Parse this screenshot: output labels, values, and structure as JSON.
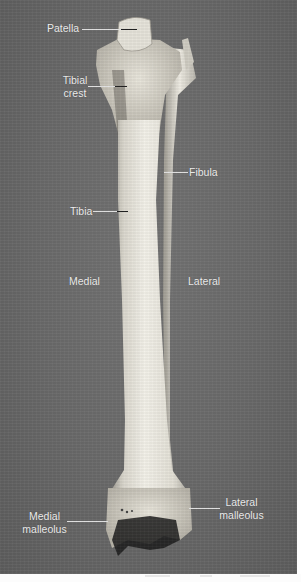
{
  "image": {
    "subject": "Tibia and fibula, anterior view",
    "background_color": "#6c6c6c",
    "bone_color": "#e4e1d8",
    "label_color": "#f2f2f2"
  },
  "labels": {
    "patella": "Patella",
    "tibial_crest_line1": "Tibial",
    "tibial_crest_line2": "crest",
    "fibula": "Fibula",
    "tibia": "Tibia",
    "medial": "Medial",
    "lateral": "Lateral",
    "medial_malleolus_line1": "Medial",
    "medial_malleolus_line2": "malleolus",
    "lateral_malleolus_line1": "Lateral",
    "lateral_malleolus_line2": "malleolus"
  }
}
